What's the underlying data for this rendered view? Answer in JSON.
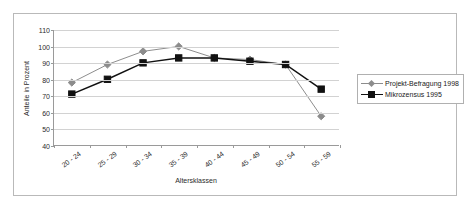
{
  "chart_data": {
    "type": "line",
    "title": "",
    "xlabel": "Altersklassen",
    "ylabel": "Anteile in Prozent",
    "categories": [
      "20 - 24",
      "25 - 29",
      "30 - 34",
      "35 - 39",
      "40 - 44",
      "45 - 49",
      "50 - 54",
      "55 - 59"
    ],
    "ylim": [
      40,
      110
    ],
    "yticks": [
      40,
      50,
      60,
      70,
      80,
      90,
      100,
      110
    ],
    "ytick_labels": [
      "40",
      "50",
      "60",
      "70",
      "80",
      "90",
      "100",
      "110"
    ],
    "grid": "horizontal",
    "legend_position": "right",
    "series": [
      {
        "name": "Projekt-Befragung 1998",
        "color": "#8c8c8c",
        "marker": "diamond",
        "values": [
          78,
          89,
          97,
          100,
          93,
          92,
          89,
          57.5
        ]
      },
      {
        "name": "Mikrozensus 1995",
        "color": "#111111",
        "marker": "square",
        "values": [
          71,
          80,
          90,
          93,
          93,
          91,
          89,
          74
        ]
      }
    ]
  },
  "legend": {
    "entries": [
      {
        "label": "Projekt-Befragung 1998"
      },
      {
        "label": "Mikrozensus 1995"
      }
    ]
  }
}
